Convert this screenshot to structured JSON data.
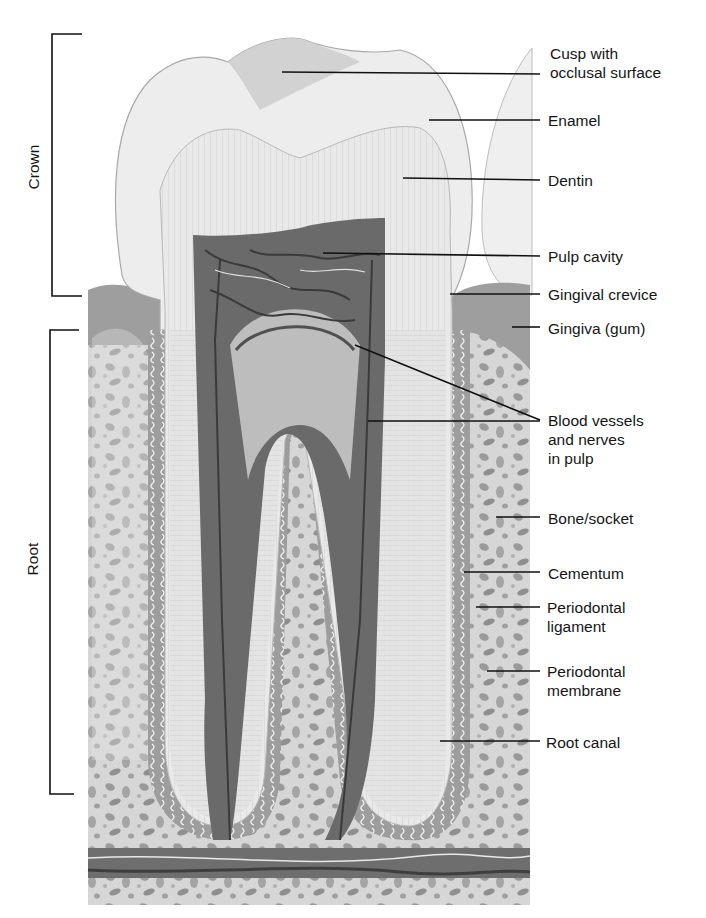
{
  "diagram": {
    "brackets": [
      {
        "id": "crown",
        "label": "Crown"
      },
      {
        "id": "root",
        "label": "Root"
      }
    ],
    "labels": [
      {
        "id": "cusp",
        "line1": "Cusp with",
        "line2": "occlusal surface"
      },
      {
        "id": "enamel",
        "line1": "Enamel"
      },
      {
        "id": "dentin",
        "line1": "Dentin"
      },
      {
        "id": "pulp-cavity",
        "line1": "Pulp cavity"
      },
      {
        "id": "gingival-crevice",
        "line1": "Gingival crevice"
      },
      {
        "id": "gingiva",
        "line1": "Gingiva (gum)"
      },
      {
        "id": "blood-vessels",
        "line1": "Blood vessels",
        "line2": "and nerves",
        "line3": "in pulp"
      },
      {
        "id": "bone-socket",
        "line1": "Bone/socket"
      },
      {
        "id": "cementum",
        "line1": "Cementum"
      },
      {
        "id": "periodontal-ligament",
        "line1": "Periodontal",
        "line2": "ligament"
      },
      {
        "id": "periodontal-membrane",
        "line1": "Periodontal",
        "line2": "membrane"
      },
      {
        "id": "root-canal",
        "line1": "Root canal"
      }
    ]
  }
}
